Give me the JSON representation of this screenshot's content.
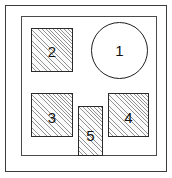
{
  "diagram": {
    "type": "layout-plan",
    "title": "",
    "frame": {
      "outer_border_color": "#3b3b3b",
      "inner_border_color": "#4a4a4a",
      "background_color": "#ffffff"
    },
    "fill": {
      "hatch_color": "#3c3c3c",
      "hatch_angle_deg": 45,
      "shape_outline_color": "#2a2a2a"
    },
    "shapes": [
      {
        "label": "1",
        "name": "circle-region-1",
        "shape": "circle",
        "fill": "none",
        "x": 91,
        "y": 22,
        "width": 57,
        "height": 57
      },
      {
        "label": "2",
        "name": "rect-region-2",
        "shape": "rectangle",
        "fill": "hatched",
        "x": 31,
        "y": 28,
        "width": 42,
        "height": 44
      },
      {
        "label": "3",
        "name": "rect-region-3",
        "shape": "rectangle",
        "fill": "hatched",
        "x": 31,
        "y": 93,
        "width": 42,
        "height": 44
      },
      {
        "label": "4",
        "name": "rect-region-4",
        "shape": "rectangle",
        "fill": "hatched",
        "x": 108,
        "y": 93,
        "width": 41,
        "height": 44
      },
      {
        "label": "5",
        "name": "rect-region-5",
        "shape": "rectangle",
        "fill": "hatched",
        "x": 78,
        "y": 106,
        "width": 25,
        "height": 50
      }
    ]
  }
}
